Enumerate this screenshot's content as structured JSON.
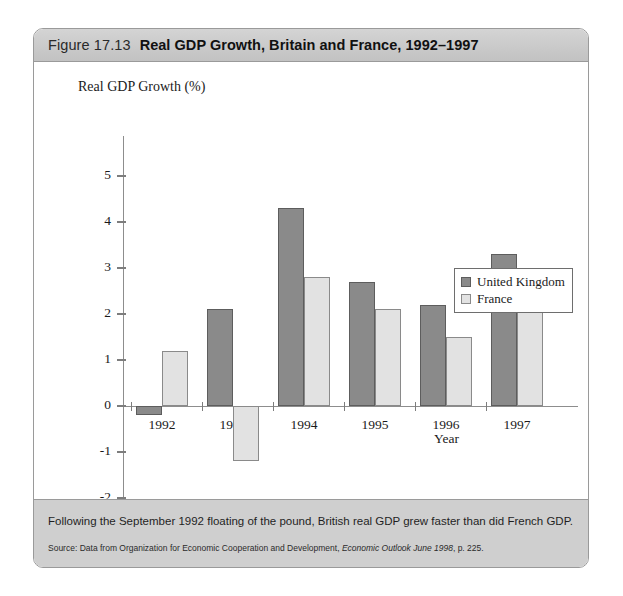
{
  "figure": {
    "number": "Figure 17.13",
    "title": "Real GDP Growth, Britain and France, 1992–1997",
    "caption": "Following the September 1992 floating of the pound, British real GDP grew faster than did French GDP.",
    "source_prefix": "Source: Data from Organization for Economic Cooperation and Development, ",
    "source_italic": "Economic Outlook June 1998",
    "source_suffix": ", p. 225."
  },
  "legend": {
    "position": "right-middle",
    "items": [
      {
        "label": "United Kingdom",
        "color": "#8a8a8a"
      },
      {
        "label": "France",
        "color": "#e2e2e2"
      }
    ]
  },
  "chart_data": {
    "type": "bar",
    "title": "Real GDP Growth, Britain and France, 1992–1997",
    "xlabel": "Year",
    "ylabel": "Real GDP Growth (%)",
    "categories": [
      "1992",
      "1993",
      "1994",
      "1995",
      "1996",
      "1997"
    ],
    "series": [
      {
        "name": "United Kingdom",
        "color": "#8a8a8a",
        "values": [
          -0.2,
          2.1,
          4.3,
          2.7,
          2.2,
          3.3
        ]
      },
      {
        "name": "France",
        "color": "#e2e2e2",
        "values": [
          1.2,
          -1.2,
          2.8,
          2.1,
          1.5,
          2.4
        ]
      }
    ],
    "ylim": [
      -2,
      5
    ],
    "yticks": [
      5,
      4,
      3,
      2,
      1,
      0,
      -1,
      -2
    ],
    "ytick_labels": [
      "5",
      "4",
      "3",
      "2",
      "1",
      "0",
      "-1",
      "-2"
    ],
    "grid": false,
    "legend_position": "right"
  }
}
